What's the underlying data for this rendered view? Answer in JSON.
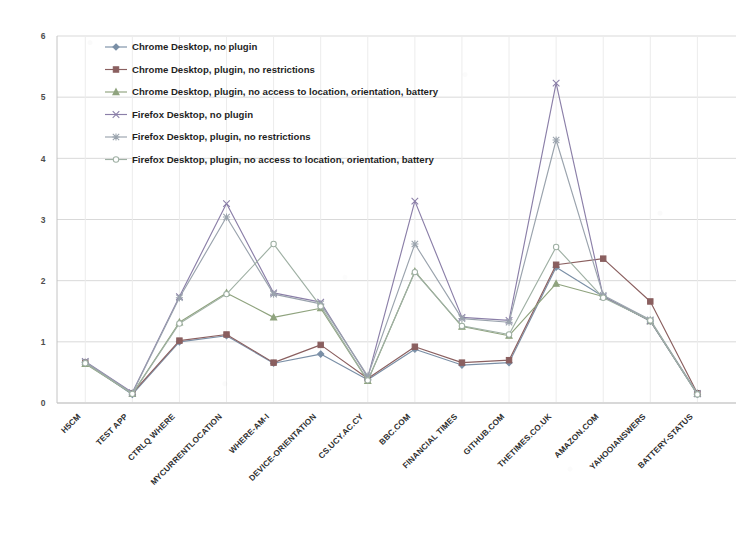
{
  "chart_data": {
    "type": "line",
    "title": "",
    "subtitle": "",
    "xlabel": "",
    "ylabel": "",
    "ylim": [
      0,
      6
    ],
    "ytick_labels": [
      "0",
      "1",
      "2",
      "3",
      "4",
      "5",
      "6"
    ],
    "ytick_values": [
      0,
      1,
      2,
      3,
      4,
      5,
      6
    ],
    "grid": "horizontal-and-vertical-faint",
    "legend_position": "top-left-inside",
    "categories": [
      "H5CM",
      "TEST APP",
      "CTRLQ WHERE",
      "MYCURRENTLOCATION",
      "WHERE-AM-I",
      "DEVICE-ORIENTATION",
      "CS.UCY.AC.CY",
      "BBC.COM",
      "FINANCIAL TIMES",
      "GITHUB.COM",
      "THETIMES.CO.UK",
      "AMAZON.COM",
      "YAHOOIANSWERS",
      "BATTERY-STATUS"
    ],
    "series": [
      {
        "name": "Chrome Desktop, no plugin",
        "marker": "diamond",
        "color": "#7a8fa6",
        "values": [
          0.66,
          0.14,
          1.0,
          1.1,
          0.65,
          0.8,
          0.38,
          0.88,
          0.62,
          0.66,
          2.22,
          1.74,
          1.34,
          0.14
        ]
      },
      {
        "name": "Chrome Desktop, plugin, no restrictions",
        "marker": "square",
        "color": "#8a5f5f",
        "values": [
          0.66,
          0.16,
          1.02,
          1.12,
          0.66,
          0.95,
          0.4,
          0.92,
          0.66,
          0.7,
          2.26,
          2.36,
          1.66,
          0.16
        ]
      },
      {
        "name": "Chrome Desktop, plugin, no access to location, orientation,  battery",
        "marker": "triangle",
        "color": "#8fa37e",
        "values": [
          0.64,
          0.15,
          1.32,
          1.8,
          1.4,
          1.55,
          0.36,
          2.15,
          1.25,
          1.1,
          1.95,
          1.74,
          1.34,
          0.15
        ]
      },
      {
        "name": "Firefox Desktop, no plugin",
        "marker": "cross",
        "color": "#8b7fa8",
        "values": [
          0.68,
          0.17,
          1.74,
          3.26,
          1.8,
          1.65,
          0.42,
          3.3,
          1.4,
          1.35,
          5.23,
          1.74,
          1.34,
          0.15
        ]
      },
      {
        "name": "Firefox Desktop, plugin, no restrictions",
        "marker": "asterisk",
        "color": "#9aa3ad",
        "values": [
          0.67,
          0.16,
          1.72,
          3.04,
          1.78,
          1.62,
          0.44,
          2.6,
          1.38,
          1.32,
          4.3,
          1.76,
          1.36,
          0.16
        ]
      },
      {
        "name": "Firefox Desktop, plugin, no access to location, orientation,  battery",
        "marker": "circle",
        "color": "#9fb0a4",
        "values": [
          0.65,
          0.15,
          1.3,
          1.78,
          2.6,
          1.58,
          0.37,
          2.14,
          1.26,
          1.12,
          2.55,
          1.72,
          1.35,
          0.14
        ]
      }
    ]
  },
  "legend": {
    "entries": [
      "Chrome Desktop, no plugin",
      "Chrome Desktop, plugin, no restrictions",
      "Chrome Desktop, plugin, no access to location, orientation,  battery",
      "Firefox Desktop, no plugin",
      "Firefox Desktop, plugin, no restrictions",
      "Firefox Desktop, plugin, no access to location, orientation,  battery"
    ]
  }
}
